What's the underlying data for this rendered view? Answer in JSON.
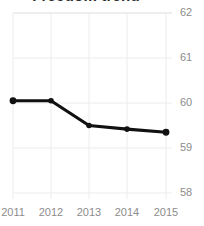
{
  "chart_data": {
    "type": "line",
    "title": "Freedom trend",
    "xlabel": "",
    "ylabel": "",
    "x": [
      "2011",
      "2012",
      "2013",
      "2014",
      "2015"
    ],
    "categories": [
      "2011",
      "2012",
      "2013",
      "2014",
      "2015"
    ],
    "values": [
      60.05,
      60.05,
      59.5,
      59.42,
      59.35
    ],
    "series": [
      {
        "name": "Freedom trend",
        "values": [
          60.05,
          60.05,
          59.5,
          59.42,
          59.35
        ]
      }
    ],
    "ylim": [
      58,
      62
    ],
    "yticks": [
      "58",
      "59",
      "60",
      "61",
      "62"
    ],
    "xticks": [
      "2011",
      "2012",
      "2013",
      "2014",
      "2015"
    ],
    "grid": true,
    "legend": false,
    "legend_position": "none",
    "y_axis_position": "right",
    "line_color": "#111111",
    "marker_color": "#111111",
    "grid_color": "#e8e8e8",
    "tick_label_color": "#8c8c8c",
    "background_color": "#ffffff",
    "title_clipped": true
  }
}
